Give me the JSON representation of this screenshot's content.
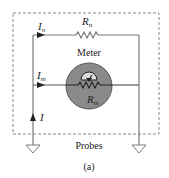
{
  "diagram": {
    "caption": "(a)",
    "probes_label": "Probes",
    "meter_label": "Meter",
    "currents": {
      "top": {
        "symbol": "I",
        "sub": "n"
      },
      "middle": {
        "symbol": "I",
        "sub": "m"
      },
      "source": {
        "symbol": "I"
      }
    },
    "resistors": {
      "shunt": {
        "symbol": "R",
        "sub": "n"
      },
      "meter": {
        "symbol": "R",
        "sub": "m"
      }
    },
    "colors": {
      "wire": "#7a7a7a",
      "meter_fill": "#8a8a8a",
      "meter_edge": "#555555",
      "dash": "#888888",
      "text": "#222222"
    }
  }
}
